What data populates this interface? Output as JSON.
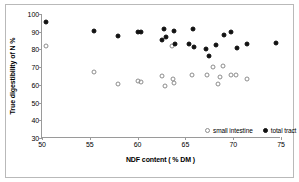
{
  "chart_data": {
    "type": "scatter",
    "title": "",
    "xlabel": "NDF content ( % DM )",
    "ylabel": "True digestibility of N %",
    "xlim": [
      50,
      75
    ],
    "ylim": [
      30,
      100
    ],
    "xticks": [
      50,
      55,
      60,
      65,
      70,
      75
    ],
    "yticks": [
      30,
      40,
      50,
      60,
      70,
      80,
      90,
      100
    ],
    "grid": false,
    "legend_position": "inside-bottom-center",
    "series": [
      {
        "name": "small intestine",
        "marker": "open-circle",
        "color": "#8d8d8d",
        "points": [
          [
            50.4,
            82.0
          ],
          [
            55.4,
            67.5
          ],
          [
            58.0,
            60.5
          ],
          [
            60.0,
            62.0
          ],
          [
            60.4,
            61.4
          ],
          [
            62.5,
            65.2
          ],
          [
            62.9,
            59.2
          ],
          [
            63.6,
            82.0
          ],
          [
            63.7,
            63.4
          ],
          [
            63.8,
            61.3
          ],
          [
            65.7,
            65.3
          ],
          [
            67.3,
            65.5
          ],
          [
            67.9,
            70.0
          ],
          [
            68.4,
            60.5
          ],
          [
            68.6,
            64.6
          ],
          [
            68.9,
            70.5
          ],
          [
            69.8,
            65.4
          ],
          [
            70.3,
            65.5
          ],
          [
            71.4,
            63.4
          ]
        ]
      },
      {
        "name": "total tract",
        "marker": "filled-circle",
        "color": "#111111",
        "points": [
          [
            50.4,
            95.5
          ],
          [
            55.4,
            90.2
          ],
          [
            58.0,
            87.5
          ],
          [
            60.0,
            90.1
          ],
          [
            60.4,
            89.7
          ],
          [
            62.5,
            85.3
          ],
          [
            62.8,
            91.5
          ],
          [
            63.0,
            87.1
          ],
          [
            63.8,
            90.4
          ],
          [
            63.9,
            83.1
          ],
          [
            65.4,
            83.2
          ],
          [
            65.8,
            91.4
          ],
          [
            65.9,
            81.2
          ],
          [
            67.2,
            80.3
          ],
          [
            67.5,
            76.4
          ],
          [
            68.2,
            82.4
          ],
          [
            69.0,
            88.3
          ],
          [
            69.8,
            89.7
          ],
          [
            70.4,
            80.6
          ],
          [
            71.4,
            83.2
          ],
          [
            74.5,
            83.6
          ]
        ]
      }
    ],
    "legend": [
      {
        "label": "small intestine",
        "marker": "open-circle"
      },
      {
        "label": "total tract",
        "marker": "filled-circle"
      }
    ]
  }
}
